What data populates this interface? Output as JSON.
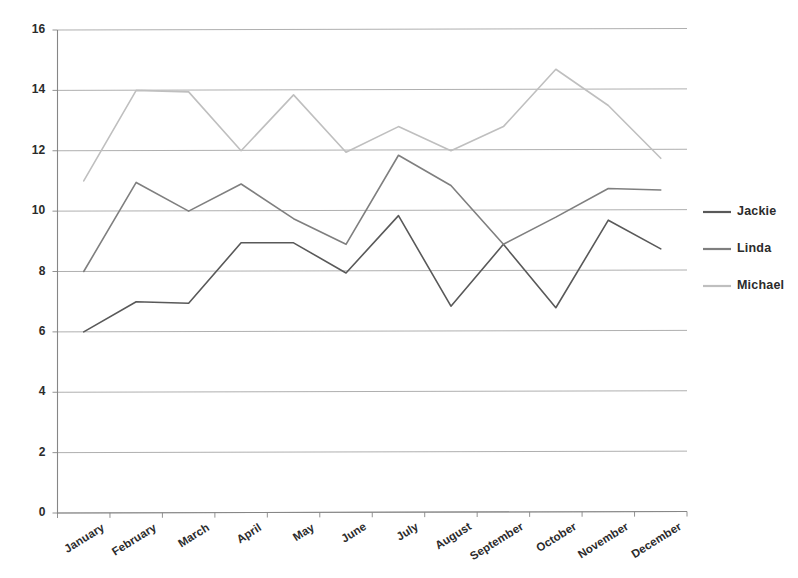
{
  "chart_data": {
    "type": "line",
    "title": "",
    "xlabel": "",
    "ylabel": "",
    "ylim": [
      0,
      16
    ],
    "ytick_step": 2,
    "yticks": [
      "0",
      "2",
      "4",
      "6",
      "8",
      "10",
      "12",
      "14",
      "16"
    ],
    "grid": true,
    "legend_position": "right",
    "categories": [
      "January",
      "February",
      "March",
      "April",
      "May",
      "June",
      "July",
      "August",
      "September",
      "October",
      "November",
      "December"
    ],
    "series": [
      {
        "name": "Jackie",
        "color": "#595959",
        "values": [
          6.0,
          7.0,
          6.95,
          8.95,
          8.95,
          7.95,
          9.85,
          6.85,
          8.9,
          6.8,
          9.7,
          8.75
        ]
      },
      {
        "name": "Linda",
        "color": "#7f7f7f",
        "values": [
          8.0,
          10.95,
          10.0,
          10.9,
          9.75,
          8.9,
          11.85,
          10.85,
          8.9,
          9.8,
          10.75,
          10.7
        ]
      },
      {
        "name": "Michael",
        "color": "#bfbfbf",
        "values": [
          11.0,
          14.0,
          13.95,
          12.0,
          13.85,
          11.95,
          12.8,
          12.0,
          12.8,
          14.7,
          13.5,
          11.75
        ]
      }
    ]
  },
  "legend": {
    "entries": [
      {
        "label": "Jackie",
        "color": "#595959"
      },
      {
        "label": "Linda",
        "color": "#7f7f7f"
      },
      {
        "label": "Michael",
        "color": "#bfbfbf"
      }
    ]
  },
  "axes": {
    "axis_color": "#868686",
    "grid_color": "#a6a6a6"
  }
}
